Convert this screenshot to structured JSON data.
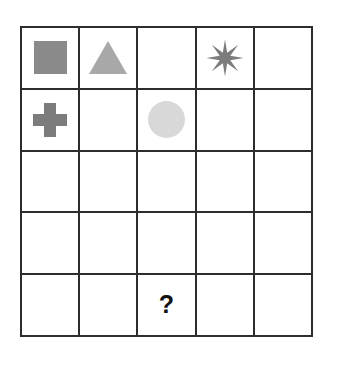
{
  "puzzle": {
    "title": "Shape Grid Puzzle",
    "grid": {
      "rows": 5,
      "columns": 5,
      "border_color": "#2d2d2d",
      "background_color": "#ffffff"
    },
    "missing_marker": "?",
    "cells": [
      [
        {
          "shape": "square",
          "label": "gray square",
          "color": "#8a8a8a"
        },
        {
          "shape": "triangle",
          "label": "gray triangle",
          "color": "#a8a8a8"
        },
        {
          "shape": "empty",
          "label": "empty cell",
          "color": ""
        },
        {
          "shape": "star",
          "label": "gray 8-point star",
          "color": "#7c7c7c"
        },
        {
          "shape": "empty",
          "label": "empty cell",
          "color": ""
        }
      ],
      [
        {
          "shape": "plus",
          "label": "gray cross",
          "color": "#7c7c7c"
        },
        {
          "shape": "empty",
          "label": "empty cell",
          "color": ""
        },
        {
          "shape": "circle",
          "label": "light gray circle",
          "color": "#d8d8d8"
        },
        {
          "shape": "empty",
          "label": "empty cell",
          "color": ""
        },
        {
          "shape": "empty",
          "label": "empty cell",
          "color": ""
        }
      ],
      [
        {
          "shape": "empty",
          "label": "empty cell",
          "color": ""
        },
        {
          "shape": "empty",
          "label": "empty cell",
          "color": ""
        },
        {
          "shape": "empty",
          "label": "empty cell",
          "color": ""
        },
        {
          "shape": "empty",
          "label": "empty cell",
          "color": ""
        },
        {
          "shape": "empty",
          "label": "empty cell",
          "color": ""
        }
      ],
      [
        {
          "shape": "empty",
          "label": "empty cell",
          "color": ""
        },
        {
          "shape": "empty",
          "label": "empty cell",
          "color": ""
        },
        {
          "shape": "empty",
          "label": "empty cell",
          "color": ""
        },
        {
          "shape": "empty",
          "label": "empty cell",
          "color": ""
        },
        {
          "shape": "empty",
          "label": "empty cell",
          "color": ""
        }
      ],
      [
        {
          "shape": "empty",
          "label": "empty cell",
          "color": ""
        },
        {
          "shape": "empty",
          "label": "empty cell",
          "color": ""
        },
        {
          "shape": "question",
          "label": "question mark",
          "color": "#111111",
          "text": "?"
        },
        {
          "shape": "empty",
          "label": "empty cell",
          "color": ""
        },
        {
          "shape": "empty",
          "label": "empty cell",
          "color": ""
        }
      ]
    ]
  }
}
